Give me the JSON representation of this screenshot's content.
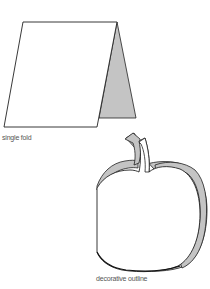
{
  "figures": [
    {
      "id": "single-fold-card",
      "caption": "single fold",
      "colors": {
        "outline": "#222222",
        "front_fill": "#ffffff",
        "back_fill": "#c4c4c4"
      }
    },
    {
      "id": "decorative-apple-card",
      "caption": "decorative outline",
      "colors": {
        "outline": "#222222",
        "front_fill": "#ffffff",
        "back_fill": "#c4c4c4"
      }
    }
  ]
}
